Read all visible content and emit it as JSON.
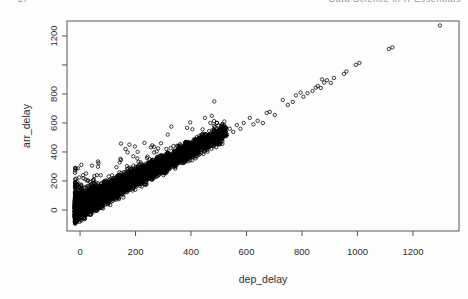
{
  "header": {
    "left_fragment": "27",
    "right_fragment": "Data Science in R Essentials"
  },
  "chart_data": {
    "type": "scatter",
    "title": "",
    "xlabel": "dep_delay",
    "ylabel": "arr_delay",
    "marker": "open-circle",
    "marker_color": "#000000",
    "frame_color": "#555555",
    "grid": false,
    "legend": "none",
    "xlim": [
      -47,
      1366
    ],
    "ylim": [
      -145,
      1303
    ],
    "x_ticks": [
      0,
      200,
      400,
      600,
      800,
      1000,
      1200
    ],
    "x_tick_labels": [
      "0",
      "200",
      "400",
      "600",
      "800",
      "1000",
      "1200"
    ],
    "y_ticks": [
      0,
      200,
      400,
      600,
      800,
      1000,
      1200
    ],
    "y_tick_labels": [
      "0",
      "200",
      "400",
      "600",
      "800",
      "",
      "1200"
    ],
    "relationship": "arr_delay is approximately equal to dep_delay; points hug the y = x diagonal from (0,0) to about (1300,1270)",
    "dense_cloud": {
      "description": "very dense solid-black wedge of flights with dep_delay roughly 0-520 and arr_delay close to dep_delay, widest vertical spread (about -90 to +300) near dep_delay 0, narrowing toward dep_delay 520",
      "n": 6200,
      "seed": 7,
      "x_min": -18,
      "x_max": 527,
      "x_power": 2.6,
      "mean_offset": 26,
      "spread_base": 80,
      "upper_fringe_prob": 0.05,
      "upper_fringe_max": 300,
      "y_floor": -95
    },
    "outlier_points": [
      [
        430,
        455
      ],
      [
        445,
        490
      ],
      [
        450,
        635
      ],
      [
        460,
        430
      ],
      [
        470,
        600
      ],
      [
        485,
        505
      ],
      [
        493,
        600
      ],
      [
        505,
        455
      ],
      [
        510,
        565
      ],
      [
        520,
        610
      ],
      [
        530,
        520
      ],
      [
        540,
        560
      ],
      [
        552,
        538
      ],
      [
        565,
        585
      ],
      [
        578,
        560
      ],
      [
        590,
        600
      ],
      [
        612,
        635
      ],
      [
        625,
        590
      ],
      [
        640,
        615
      ],
      [
        659,
        600
      ],
      [
        673,
        669
      ],
      [
        684,
        676
      ],
      [
        702,
        655
      ],
      [
        731,
        759
      ],
      [
        749,
        724
      ],
      [
        767,
        745
      ],
      [
        778,
        790
      ],
      [
        795,
        810
      ],
      [
        805,
        780
      ],
      [
        820,
        805
      ],
      [
        838,
        820
      ],
      [
        850,
        843
      ],
      [
        857,
        855
      ],
      [
        868,
        841
      ],
      [
        872,
        900
      ],
      [
        880,
        878
      ],
      [
        890,
        895
      ],
      [
        904,
        876
      ],
      [
        915,
        910
      ],
      [
        951,
        938
      ],
      [
        960,
        955
      ],
      [
        994,
        1000
      ],
      [
        1007,
        1014
      ],
      [
        1113,
        1110
      ],
      [
        1126,
        1122
      ],
      [
        1297,
        1272
      ]
    ]
  }
}
